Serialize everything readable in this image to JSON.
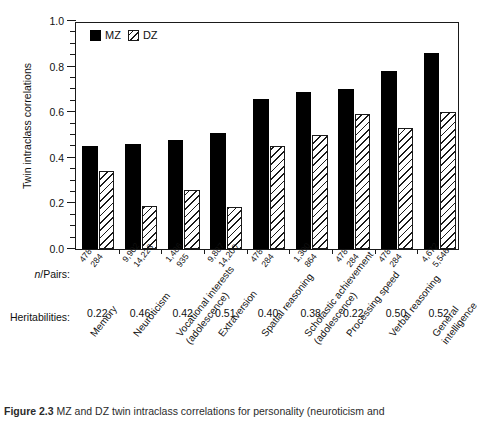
{
  "figure": {
    "caption_prefix": "Figure 2.3",
    "caption_text": "MZ and DZ twin intraclass correlations for personality (neuroticism and"
  },
  "axis": {
    "ylabel": "Twin intraclass correlations",
    "yticks": [
      "0.0",
      "0.2",
      "0.4",
      "0.6",
      "0.8",
      "1.0"
    ],
    "ymin": 0.0,
    "ymax": 1.0,
    "minor_tick_step": 0.05
  },
  "legend": {
    "position": "top-left-inside",
    "items": [
      {
        "label": "MZ",
        "swatch": "solid-black-square"
      },
      {
        "label": "DZ",
        "swatch": "hatched-square"
      }
    ]
  },
  "rows": {
    "npairs_label": "n/Pairs:",
    "heritabilities_label": "Heritabilities:"
  },
  "chart_data": {
    "type": "bar",
    "title": "",
    "xlabel": "",
    "ylabel": "Twin intraclass correlations",
    "ylim": [
      0.0,
      1.0
    ],
    "grid": false,
    "legend_position": "top-left",
    "categories": [
      "Memory",
      "Neuroticism",
      "Vocational interests (adolescence)",
      "Extraversion",
      "Spatial reasoning",
      "Scholastic achievement (adolescence)",
      "Processing speed",
      "Verbal reasoning",
      "General intelligence"
    ],
    "category_lines": [
      [
        "Memory",
        ""
      ],
      [
        "Neuroticism",
        ""
      ],
      [
        "Vocational interests",
        "(adolescence)"
      ],
      [
        "Extraversion",
        ""
      ],
      [
        "Spatial reasoning",
        ""
      ],
      [
        "Scholastic achievement",
        "(adolescence)"
      ],
      [
        "Processing speed",
        ""
      ],
      [
        "Verbal reasoning",
        ""
      ],
      [
        "General",
        "intelligence"
      ]
    ],
    "series": [
      {
        "name": "MZ",
        "values": [
          0.45,
          0.46,
          0.48,
          0.51,
          0.66,
          0.69,
          0.7,
          0.78,
          0.86
        ]
      },
      {
        "name": "DZ",
        "values": [
          0.34,
          0.19,
          0.26,
          0.185,
          0.45,
          0.5,
          0.59,
          0.53,
          0.6
        ]
      }
    ],
    "heritabilities": [
      "0.22",
      "0.46",
      "0.42",
      "0.51",
      "0.40",
      "0.38",
      "0.22",
      "0.50",
      "0.52"
    ],
    "npairs_mz": [
      "478",
      "9,902",
      "1,486",
      "9,887",
      "478",
      "1,300",
      "478",
      "478",
      "4,672"
    ],
    "npairs_dz": [
      "284",
      "14,223",
      "935",
      "14,200",
      "284",
      "864",
      "284",
      "284",
      "5,546"
    ]
  }
}
